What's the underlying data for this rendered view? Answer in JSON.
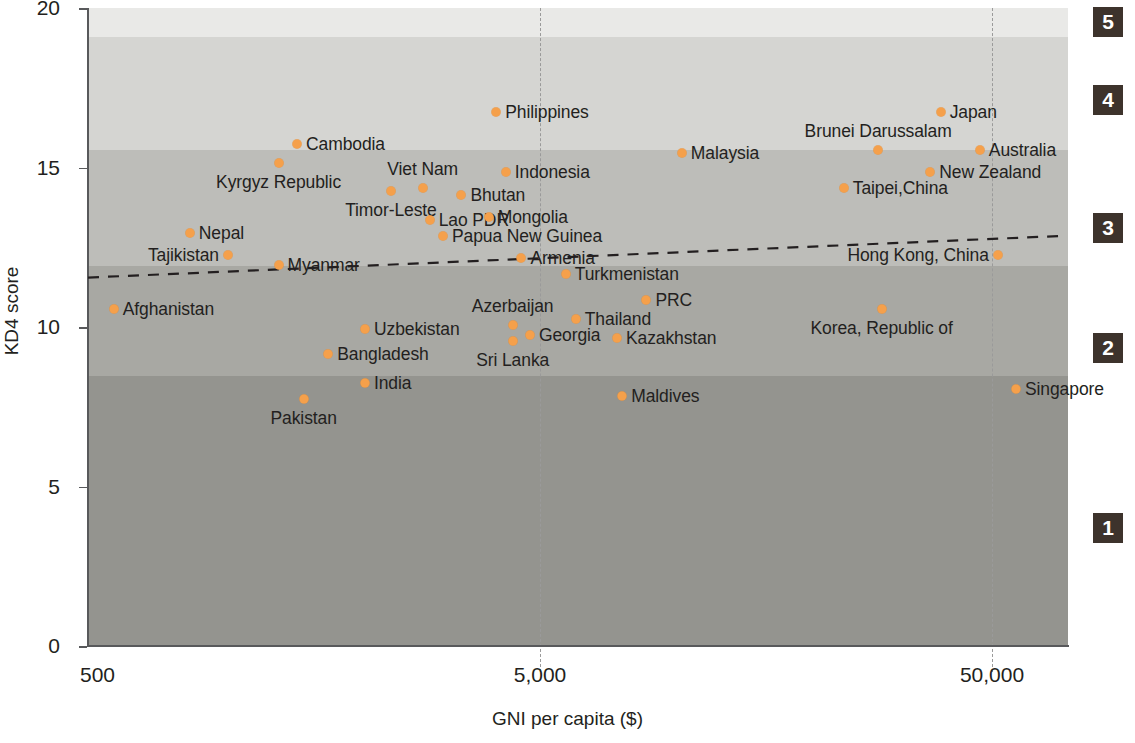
{
  "chart_data": {
    "type": "scatter",
    "title": "",
    "xlabel": "GNI per capita ($)",
    "ylabel": "KD4 score",
    "x_scale": "log",
    "x_tick_labels": [
      "500",
      "5,000",
      "50,000"
    ],
    "x_tick_values": [
      500,
      5000,
      50000
    ],
    "y_tick_labels": [
      "0",
      "5",
      "10",
      "15",
      "20"
    ],
    "y_tick_values": [
      0,
      5,
      10,
      15,
      20
    ],
    "ylim": [
      0,
      20
    ],
    "grid": false,
    "legend": null,
    "point_color": "#f5a04b",
    "trendline": {
      "style": "dashed",
      "color": "#231f20",
      "x_start": 500,
      "y_start": 11.55,
      "x_end": 70000,
      "y_end": 12.85
    },
    "bands": [
      {
        "level": "5",
        "y_min": 19.1,
        "y_max": 20.0,
        "color": "#e9e9e7"
      },
      {
        "level": "4",
        "y_min": 15.55,
        "y_max": 19.1,
        "color": "#d5d5d2"
      },
      {
        "level": "3",
        "y_min": 11.9,
        "y_max": 15.55,
        "color": "#bdbdb9"
      },
      {
        "level": "2",
        "y_min": 8.45,
        "y_max": 11.9,
        "color": "#a8a8a3"
      },
      {
        "level": "1",
        "y_min": 0.0,
        "y_max": 8.45,
        "color": "#94948f"
      }
    ],
    "points": [
      {
        "name": "Afghanistan",
        "x": 570,
        "y": 10.55,
        "label_side": "right"
      },
      {
        "name": "Tajikistan",
        "x": 1020,
        "y": 12.25,
        "label_side": "left"
      },
      {
        "name": "Nepal",
        "x": 840,
        "y": 12.95,
        "label_side": "right"
      },
      {
        "name": "Kyrgyz Republic",
        "x": 1320,
        "y": 15.15,
        "label_side": "below"
      },
      {
        "name": "Cambodia",
        "x": 1450,
        "y": 15.75,
        "label_side": "right"
      },
      {
        "name": "Myanmar",
        "x": 1320,
        "y": 11.95,
        "label_side": "right"
      },
      {
        "name": "Timor-Leste",
        "x": 2340,
        "y": 14.25,
        "label_side": "below"
      },
      {
        "name": "Viet Nam",
        "x": 2750,
        "y": 14.35,
        "label_side": "above"
      },
      {
        "name": "Bhutan",
        "x": 3350,
        "y": 14.15,
        "label_side": "right"
      },
      {
        "name": "Lao PDR",
        "x": 2850,
        "y": 13.35,
        "label_side": "right"
      },
      {
        "name": "Mongolia",
        "x": 3850,
        "y": 13.45,
        "label_side": "right"
      },
      {
        "name": "Indonesia",
        "x": 4200,
        "y": 14.85,
        "label_side": "right"
      },
      {
        "name": "Papua New Guinea",
        "x": 3050,
        "y": 12.85,
        "label_side": "right"
      },
      {
        "name": "Armenia",
        "x": 4550,
        "y": 12.15,
        "label_side": "right"
      },
      {
        "name": "Philippines",
        "x": 4000,
        "y": 16.75,
        "label_side": "right"
      },
      {
        "name": "Uzbekistan",
        "x": 2050,
        "y": 9.95,
        "label_side": "right"
      },
      {
        "name": "Bangladesh",
        "x": 1700,
        "y": 9.15,
        "label_side": "right"
      },
      {
        "name": "India",
        "x": 2050,
        "y": 8.25,
        "label_side": "right"
      },
      {
        "name": "Pakistan",
        "x": 1500,
        "y": 7.75,
        "label_side": "below"
      },
      {
        "name": "Azerbaijan",
        "x": 4350,
        "y": 10.05,
        "label_side": "above"
      },
      {
        "name": "Sri Lanka",
        "x": 4350,
        "y": 9.55,
        "label_side": "below"
      },
      {
        "name": "Georgia",
        "x": 4750,
        "y": 9.75,
        "label_side": "right"
      },
      {
        "name": "Thailand",
        "x": 6000,
        "y": 10.25,
        "label_side": "right"
      },
      {
        "name": "Kazakhstan",
        "x": 7400,
        "y": 9.65,
        "label_side": "right"
      },
      {
        "name": "Turkmenistan",
        "x": 5700,
        "y": 11.65,
        "label_side": "right"
      },
      {
        "name": "PRC",
        "x": 8600,
        "y": 10.85,
        "label_side": "right"
      },
      {
        "name": "Maldives",
        "x": 7600,
        "y": 7.85,
        "label_side": "right"
      },
      {
        "name": "Malaysia",
        "x": 10300,
        "y": 15.45,
        "label_side": "right"
      },
      {
        "name": "Brunei Darussalam",
        "x": 28000,
        "y": 15.55,
        "label_side": "above"
      },
      {
        "name": "Japan",
        "x": 38500,
        "y": 16.75,
        "label_side": "right"
      },
      {
        "name": "Australia",
        "x": 47000,
        "y": 15.55,
        "label_side": "right"
      },
      {
        "name": "New Zealand",
        "x": 36500,
        "y": 14.85,
        "label_side": "right"
      },
      {
        "name": "Taipei,China",
        "x": 23500,
        "y": 14.35,
        "label_side": "right"
      },
      {
        "name": "Hong Kong, China",
        "x": 51500,
        "y": 12.25,
        "label_side": "left"
      },
      {
        "name": "Korea, Republic of",
        "x": 28500,
        "y": 10.55,
        "label_side": "below"
      },
      {
        "name": "Singapore",
        "x": 56500,
        "y": 8.05,
        "label_side": "right"
      }
    ]
  },
  "axes": {
    "y_title": "KD4 score",
    "x_title": "GNI per capita ($)",
    "y_ticks": [
      "20",
      "15",
      "10",
      "5",
      "0"
    ],
    "x_ticks": [
      "500",
      "5,000",
      "50,000"
    ]
  },
  "levels": [
    {
      "label": "5"
    },
    {
      "label": "4"
    },
    {
      "label": "3"
    },
    {
      "label": "2"
    },
    {
      "label": "1"
    }
  ]
}
